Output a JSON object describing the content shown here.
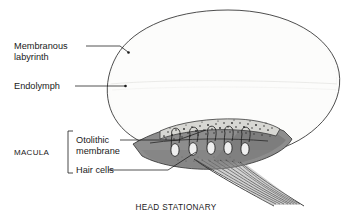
{
  "figure": {
    "title_caption": "HEAD STATIONARY",
    "labels": {
      "membranous_labyrinth_line1": "Membranous",
      "membranous_labyrinth_line2": "labyrinth",
      "endolymph": "Endolymph",
      "macula": "MACULA",
      "otolithic_membrane_line1": "Otolithic",
      "otolithic_membrane_line2": "membrane",
      "hair_cells": "Hair cells"
    },
    "colors": {
      "outline": "#1a1a1a",
      "wall_line": "#555555",
      "endolymph_fill": "#fbfbfa",
      "macula_fill": "#8d8d8d",
      "macula_fill_dark": "#6f6f6f",
      "otolith_layer": "#d9d9d6",
      "otolith_granule": "#2b2b2b",
      "nerve_fiber": "#5a5a5a",
      "text": "#1a1a1a",
      "background": "#ffffff"
    },
    "structure": {
      "hair_cell_count": 5,
      "hair_cell_x_positions": [
        175,
        193,
        211,
        228,
        245
      ],
      "chamber_shape": "ellipse",
      "wall_layers": 2
    }
  }
}
